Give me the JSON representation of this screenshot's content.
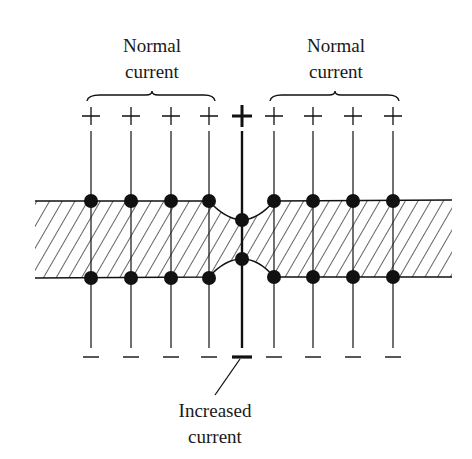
{
  "labels": {
    "left_group": [
      "Normal",
      "current"
    ],
    "right_group": [
      "Normal",
      "current"
    ],
    "bottom": [
      "Increased",
      "current"
    ]
  },
  "symbols": {
    "top": "+",
    "bottom": "−"
  },
  "colors": {
    "ink": "#111111",
    "background": "#ffffff"
  },
  "layout": {
    "columns_x": [
      91,
      131,
      171,
      209,
      274,
      313,
      353,
      393
    ],
    "center_x": 242,
    "band_top_y": 201,
    "band_bottom_y": 277,
    "band_left_x": 35,
    "band_right_x": 452,
    "neck_top_y": 220,
    "neck_bottom_y": 259
  }
}
